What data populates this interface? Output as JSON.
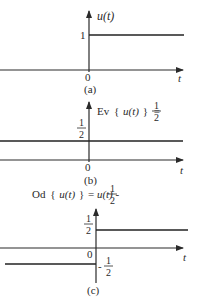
{
  "figure": {
    "panels": [
      {
        "id": "a",
        "caption": "(a)",
        "title": "u(t)",
        "y_ticks": [
          "1"
        ],
        "origin_label": "0",
        "x_axis_label": "t",
        "signal": "unit step: 0 for t<0, 1 for t>0"
      },
      {
        "id": "b",
        "caption": "(b)",
        "title_prefix": "Ev",
        "title_open": "{",
        "title_arg": "u(t)",
        "title_close": "}",
        "title_eq": "=",
        "title_frac_num": "1",
        "title_frac_den": "2",
        "y_tick_num": "1",
        "y_tick_den": "2",
        "origin_label": "0",
        "x_axis_label": "t",
        "signal": "constant 1/2"
      },
      {
        "id": "c",
        "caption": "(c)",
        "title_prefix": "Od",
        "title_open": "{",
        "title_arg": "u(t)",
        "title_close": "}",
        "title_eq": "=",
        "title_rhs": "u(t)",
        "title_minus": "-",
        "title_frac_num": "1",
        "title_frac_den": "2",
        "pos_tick_num": "1",
        "pos_tick_den": "2",
        "neg_tick_sign": "-",
        "neg_tick_num": "1",
        "neg_tick_den": "2",
        "origin_label": "0",
        "x_axis_label": "t",
        "signal": "-1/2 for t<0, +1/2 for t>0"
      }
    ]
  }
}
